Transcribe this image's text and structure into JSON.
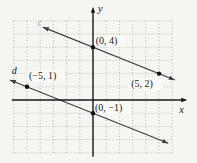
{
  "figure": {
    "background": "#f5f5f2",
    "label_patch_color": "#f9f9f6",
    "grid_color": "#a3a89f",
    "axis_color": "#1a1a1a",
    "line_color": "#3f3f3f",
    "point_color": "#111111",
    "text_color": "#1a1a1a"
  },
  "chart_data": {
    "type": "line",
    "title": "",
    "xlabel": "x",
    "ylabel": "y",
    "xlim": [
      -6,
      6
    ],
    "ylim": [
      -4,
      6
    ],
    "grid": "dotted",
    "legend": "none",
    "series": [
      {
        "name": "c",
        "points": [
          [
            0,
            4
          ],
          [
            5,
            2
          ]
        ],
        "slope": -0.4,
        "x_draw": [
          -3.8,
          6.2
        ],
        "arrows": "both"
      },
      {
        "name": "d",
        "points": [
          [
            -5,
            1
          ],
          [
            0,
            -1
          ]
        ],
        "slope": -0.4,
        "x_draw": [
          -6.3,
          5.7
        ],
        "arrows": "both"
      }
    ],
    "annotations": [
      {
        "text": "(0, 4)",
        "x": 0.2,
        "y": 4.25,
        "bg": true,
        "italic": false,
        "faint": false
      },
      {
        "text": "(5, 2)",
        "x": 2.9,
        "y": 1.0,
        "bg": true,
        "italic": false,
        "faint": false
      },
      {
        "text": "(−5, 1)",
        "x": -4.85,
        "y": 1.62,
        "bg": true,
        "italic": false,
        "faint": false
      },
      {
        "text": "(0, −1)",
        "x": 0.15,
        "y": -0.85,
        "bg": true,
        "italic": false,
        "faint": false
      },
      {
        "text": "d",
        "x": -6.15,
        "y": 2.0,
        "bg": false,
        "italic": true,
        "faint": false
      },
      {
        "text": "c",
        "x": -4.2,
        "y": 5.6,
        "bg": false,
        "italic": true,
        "faint": true
      }
    ]
  }
}
